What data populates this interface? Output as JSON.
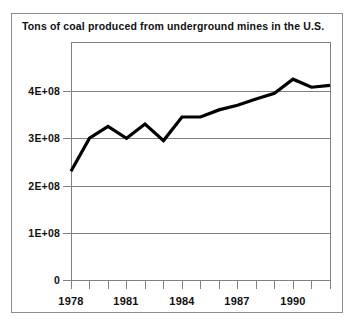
{
  "chart_data": {
    "type": "line",
    "title": "Tons of coal produced from underground mines in the U.S.",
    "xlabel": "",
    "ylabel": "",
    "x": [
      1978,
      1979,
      1980,
      1981,
      1982,
      1983,
      1984,
      1985,
      1986,
      1987,
      1988,
      1989,
      1990,
      1991,
      1992
    ],
    "values": [
      230000000,
      300000000,
      325000000,
      300000000,
      330000000,
      295000000,
      345000000,
      345000000,
      360000000,
      370000000,
      383000000,
      395000000,
      425000000,
      408000000,
      412000000
    ],
    "series": [
      {
        "name": "Tons of coal produced from underground mines in the U.S.",
        "values": [
          230000000,
          300000000,
          325000000,
          300000000,
          330000000,
          295000000,
          345000000,
          345000000,
          360000000,
          370000000,
          383000000,
          395000000,
          425000000,
          408000000,
          412000000
        ]
      }
    ],
    "xlim": [
      1978,
      1992
    ],
    "ylim": [
      0,
      500000000
    ],
    "yticks": [
      0,
      100000000,
      200000000,
      300000000,
      400000000
    ],
    "ytick_labels": [
      "0",
      "1E+08",
      "2E+08",
      "3E+08",
      "4E+08"
    ],
    "xticks": [
      1978,
      1979,
      1980,
      1981,
      1982,
      1983,
      1984,
      1985,
      1986,
      1987,
      1988,
      1989,
      1990,
      1991,
      1992
    ],
    "xtick_labels": [
      "1978",
      "",
      "",
      "1981",
      "",
      "",
      "1984",
      "",
      "",
      "1987",
      "",
      "",
      "1990",
      "",
      ""
    ],
    "xtick_labels_shown": [
      "1978",
      "1981",
      "1984",
      "1987",
      "1990"
    ],
    "grid": true,
    "grid_axis": "y",
    "legend": false,
    "legend_position": "none",
    "line_color": "#000000",
    "grid_color": "#808080",
    "axis_color": "#808080",
    "background_color": "#ffffff",
    "border_color": "#8c8c8c"
  }
}
